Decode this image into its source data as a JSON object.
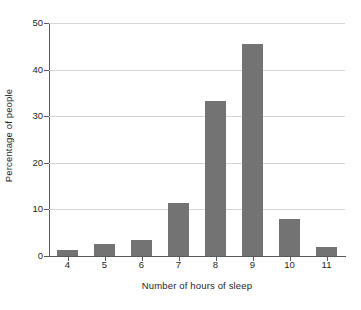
{
  "chart_data": {
    "type": "bar",
    "title": "",
    "subtitle": "",
    "xlabel": "Number of hours of sleep",
    "ylabel": "Percentage of people",
    "categories": [
      "4",
      "5",
      "6",
      "7",
      "8",
      "9",
      "10",
      "11"
    ],
    "values": [
      1.3,
      2.6,
      3.4,
      11.4,
      33.3,
      45.5,
      8.0,
      1.9
    ],
    "ylim": [
      0,
      50
    ],
    "yticks": [
      0,
      10,
      20,
      30,
      40,
      50
    ],
    "ytick_labels": [
      "0",
      "10",
      "20",
      "30",
      "40",
      "50"
    ],
    "grid": "horizontal",
    "legend": "none",
    "annotations": [],
    "colors": {
      "bar": "#737373",
      "gridline": "#d6d6d6",
      "axis": "#58595b",
      "text": "#231f20",
      "background": "#ffffff"
    }
  }
}
